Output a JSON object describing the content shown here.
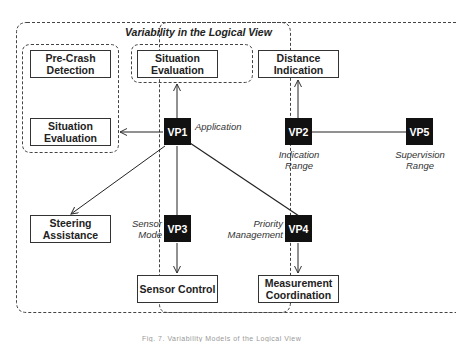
{
  "diagram": {
    "title": "Variability in the Logical View",
    "components": {
      "pre_crash_detection": "Pre-Crash Detection",
      "situation_evaluation_left": "Situation Evaluation",
      "situation_evaluation_top": "Situation Evaluation",
      "distance_indication": "Distance Indication",
      "steering_assistance": "Steering Assistance",
      "sensor_control": "Sensor Control",
      "measurement_coordination": "Measurement Coordination"
    },
    "variation_points": {
      "vp1": {
        "id": "VP1",
        "label": "Application"
      },
      "vp2": {
        "id": "VP2",
        "label_line1": "Indication",
        "label_line2": "Range"
      },
      "vp3": {
        "id": "VP3",
        "label_line1": "Sensor",
        "label_line2": "Mode"
      },
      "vp4": {
        "id": "VP4",
        "label_line1": "Priority",
        "label_line2": "Management"
      },
      "vp5": {
        "id": "VP5",
        "label_line1": "Supervision",
        "label_line2": "Range"
      }
    },
    "edges": [
      {
        "from": "VP1",
        "to": "Situation Evaluation (top group)"
      },
      {
        "from": "VP1",
        "to": "Left group (Pre-Crash Detection / Situation Evaluation)"
      },
      {
        "from": "VP1",
        "to": "Steering Assistance"
      },
      {
        "from": "VP1",
        "to": "VP3"
      },
      {
        "from": "VP1",
        "to": "VP4"
      },
      {
        "from": "VP2",
        "to": "Distance Indication"
      },
      {
        "from": "VP2",
        "to": "VP5"
      },
      {
        "from": "VP3",
        "to": "Sensor Control"
      },
      {
        "from": "VP4",
        "to": "Measurement Coordination"
      }
    ],
    "caption": "Fig. 7. Variability Models of the Logical View"
  }
}
